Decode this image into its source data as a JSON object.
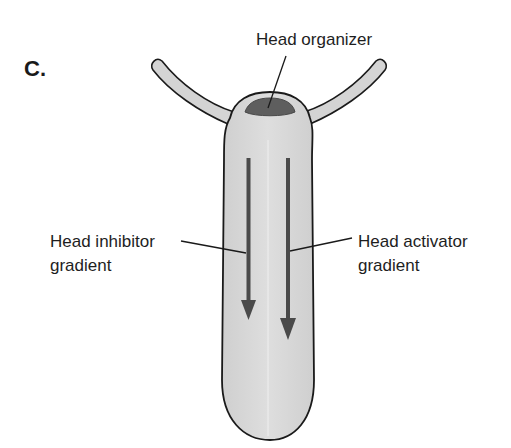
{
  "panel_label": "C.",
  "labels": {
    "head_organizer": "Head organizer",
    "head_inhibitor_line1": "Head inhibitor",
    "head_inhibitor_line2": "gradient",
    "head_activator_line1": "Head activator",
    "head_activator_line2": "gradient"
  },
  "colors": {
    "body_fill": "#d4d4d4",
    "outline": "#1a1a1a",
    "organizer_fill": "#5e5e5e",
    "arrow_fill": "#4a4a4a"
  }
}
